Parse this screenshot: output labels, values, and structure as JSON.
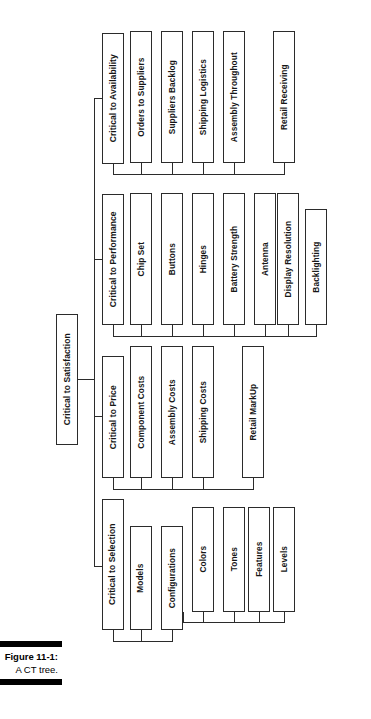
{
  "figure": {
    "number_label": "Figure 11-1:",
    "title_label": "A CT tree.",
    "bar_color": "#000000"
  },
  "diagram": {
    "type": "tree",
    "orientation": "rotated-90-counterclockwise",
    "line_color": "#2b2b2b",
    "box_fill": "#ffffff",
    "root": {
      "label": "Critical to Satisfaction"
    },
    "branches": [
      {
        "label": "Critical to Availability",
        "children": [
          {
            "label": "Orders to Suppliers"
          },
          {
            "label": "Suppliers Backlog"
          },
          {
            "label": "Shipping Logistics"
          },
          {
            "label": "Assembly Throughout"
          },
          {
            "label": "Retail Receiving"
          }
        ]
      },
      {
        "label": "Critical to Performance",
        "children": [
          {
            "label": "Chip Set"
          },
          {
            "label": "Buttons"
          },
          {
            "label": "Hinges"
          },
          {
            "label": "Battery Strength"
          },
          {
            "label": "Antenna"
          },
          {
            "label": "Display Resolution"
          },
          {
            "label": "Backlighting"
          }
        ]
      },
      {
        "label": "Critical to Price",
        "children": [
          {
            "label": "Component Costs"
          },
          {
            "label": "Assembly Costs"
          },
          {
            "label": "Shipping Costs"
          },
          {
            "label": "Retail MarkUp"
          }
        ]
      },
      {
        "label": "Critical to Selection",
        "children": [
          {
            "label": "Models"
          },
          {
            "label": "Configurations",
            "children": [
              {
                "label": "Colors"
              },
              {
                "label": "Tones"
              },
              {
                "label": "Features"
              },
              {
                "label": "Levels"
              }
            ]
          }
        ]
      }
    ]
  }
}
